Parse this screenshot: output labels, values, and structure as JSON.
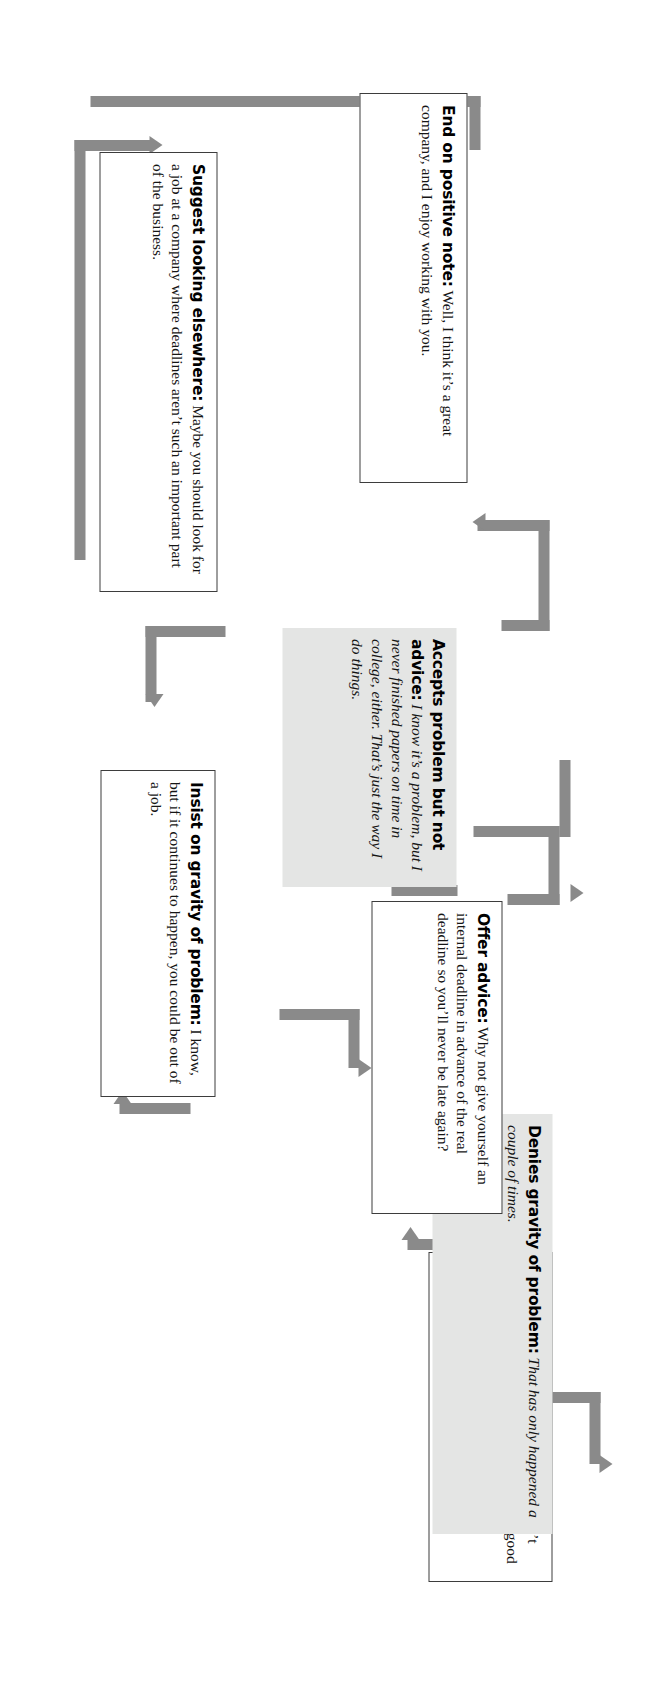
{
  "diagram": {
    "type": "flowchart",
    "colors": {
      "connector": "#8a8a8a",
      "response_box_fill": "#e4e5e4",
      "prompt_box_fill": "#ffffff",
      "prompt_box_border": "#3d3d3d",
      "text": "#151515"
    },
    "nodes": [
      {
        "id": "focus",
        "style": "white",
        "heading": "Focus her on real problem:",
        "body": "I didn’t realize you did that. That’s obviously not a good idea, but I was talking about how you don’t complete all your assignments on time."
      },
      {
        "id": "denies",
        "style": "gray",
        "heading": "Denies gravity of problem:",
        "body": "That has only happened a couple of times."
      },
      {
        "id": "offer",
        "style": "white",
        "heading": "Offer advice:",
        "body": "Why not give yourself an internal deadline in advance of the real deadline so you’ll never be late again?"
      },
      {
        "id": "accepts",
        "style": "gray",
        "heading": "Accepts problem but not advice:",
        "body": "I know it’s a problem, but I never finished papers on time in college, either. That’s just the way I do things."
      },
      {
        "id": "insist",
        "style": "white",
        "heading": "Insist on gravity of problem:",
        "body": "I know, but if it continues to happen, you could be out of a job."
      },
      {
        "id": "suggest",
        "style": "white",
        "heading": "Suggest looking elsewhere:",
        "body": "Maybe you should look for a job at a company where deadlines aren’t such an important part of the business."
      },
      {
        "id": "end",
        "style": "white",
        "heading": "End on positive note:",
        "body": "Well, I think it’s a great company, and I enjoy working with you."
      }
    ],
    "edges": [
      {
        "id": "entry-focus",
        "from": "entry",
        "to": "focus"
      },
      {
        "id": "focus-denies",
        "from": "focus",
        "to": "denies"
      },
      {
        "id": "denies-insist",
        "from": "denies",
        "to": "insist"
      },
      {
        "id": "insist-offer",
        "from": "insist",
        "to": "offer"
      },
      {
        "id": "offer-accepts",
        "from": "offer",
        "to": "accepts"
      },
      {
        "id": "accepts-suggest",
        "from": "accepts",
        "to": "suggest"
      },
      {
        "id": "insist-suggest",
        "from": "insist",
        "to": "suggest"
      },
      {
        "id": "suggest-end",
        "from": "suggest",
        "to": "end"
      },
      {
        "id": "loop-to-offer",
        "from": "accepts",
        "to": "offer"
      }
    ]
  }
}
